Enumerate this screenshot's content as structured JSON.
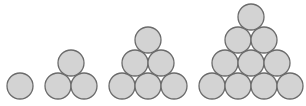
{
  "diagram": {
    "circle_radius": 13,
    "fill_color": "#d3d3d3",
    "stroke_color": "#6b6b6b",
    "groups": [
      {
        "count": 1,
        "circles": [
          [
            20,
            86
          ]
        ]
      },
      {
        "count": 3,
        "circles": [
          [
            58,
            86
          ],
          [
            84,
            86
          ],
          [
            71,
            63
          ]
        ]
      },
      {
        "count": 6,
        "circles": [
          [
            122,
            86
          ],
          [
            148,
            86
          ],
          [
            174,
            86
          ],
          [
            135,
            63
          ],
          [
            161,
            63
          ],
          [
            148,
            40
          ]
        ]
      },
      {
        "count": 10,
        "circles": [
          [
            212,
            86
          ],
          [
            238,
            86
          ],
          [
            264,
            86
          ],
          [
            290,
            86
          ],
          [
            225,
            63
          ],
          [
            251,
            63
          ],
          [
            277,
            63
          ],
          [
            238,
            40
          ],
          [
            264,
            40
          ],
          [
            251,
            17
          ]
        ]
      }
    ]
  }
}
